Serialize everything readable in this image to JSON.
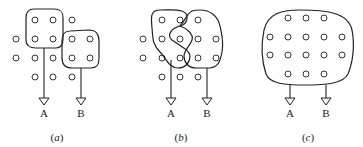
{
  "figure": {
    "panels": [
      {
        "id": "a",
        "caption_letter": "a",
        "outputs": [
          {
            "label": "A"
          },
          {
            "label": "B"
          }
        ],
        "description": "Two separate receptive fields: A covers 4 units at top-left, B covers 4 units at right"
      },
      {
        "id": "b",
        "caption_letter": "b",
        "outputs": [
          {
            "label": "A"
          },
          {
            "label": "B"
          }
        ],
        "description": "Two overlapping receptive fields A and B sharing a central region"
      },
      {
        "id": "c",
        "caption_letter": "c",
        "outputs": [
          {
            "label": "A"
          },
          {
            "label": "B"
          }
        ],
        "description": "One large receptive field covering all units, feeding both A and B"
      }
    ],
    "colors": {
      "stroke": "#222222",
      "background": "#ffffff"
    }
  }
}
